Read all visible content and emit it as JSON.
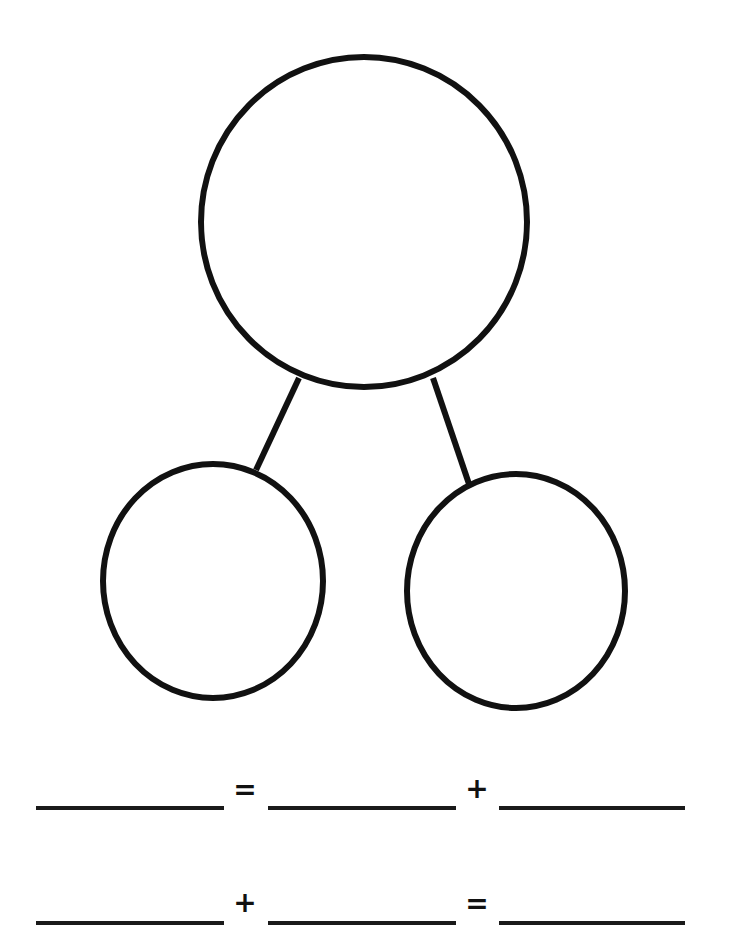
{
  "worksheet": {
    "type": "number-bond",
    "stroke_color": "#111111",
    "background": "#ffffff",
    "whole_circle": {
      "cx": 364,
      "cy": 222,
      "rx": 163,
      "ry": 165
    },
    "part_circles": [
      {
        "cx": 213,
        "cy": 581,
        "rx": 110,
        "ry": 117
      },
      {
        "cx": 516,
        "cy": 591,
        "rx": 109,
        "ry": 117
      }
    ],
    "connectors": [
      {
        "x1": 299,
        "y1": 378,
        "x2": 256,
        "y2": 470
      },
      {
        "x1": 433,
        "y1": 378,
        "x2": 469,
        "y2": 484
      }
    ],
    "equations": [
      {
        "operators": [
          "=",
          "+"
        ],
        "blanks": [
          "",
          "",
          ""
        ]
      },
      {
        "operators": [
          "+",
          "="
        ],
        "blanks": [
          "",
          "",
          ""
        ]
      }
    ]
  }
}
